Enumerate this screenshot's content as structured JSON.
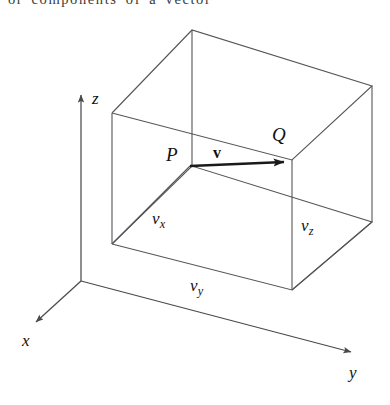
{
  "caption": {
    "text": "or  components  of  a  vector",
    "clipped": true
  },
  "figure": {
    "background_color": "#ffffff",
    "line_color": "#4a4a4a",
    "vector_color": "#1a1a1a",
    "axes": [
      {
        "name": "x-axis",
        "label": "x",
        "direction": "down-left"
      },
      {
        "name": "y-axis",
        "label": "y",
        "direction": "down-right"
      },
      {
        "name": "z-axis",
        "label": "z",
        "direction": "up"
      }
    ],
    "points": [
      {
        "name": "point-p",
        "label": "P"
      },
      {
        "name": "point-q",
        "label": "Q"
      }
    ],
    "vector": {
      "name": "vector-v",
      "label": "v",
      "from": "P",
      "to": "Q",
      "style": "bold-italic-arrow"
    },
    "components": [
      {
        "name": "component-vx",
        "base": "v",
        "subscript": "x"
      },
      {
        "name": "component-vy",
        "base": "v",
        "subscript": "y"
      },
      {
        "name": "component-vz",
        "base": "v",
        "subscript": "z"
      }
    ]
  }
}
